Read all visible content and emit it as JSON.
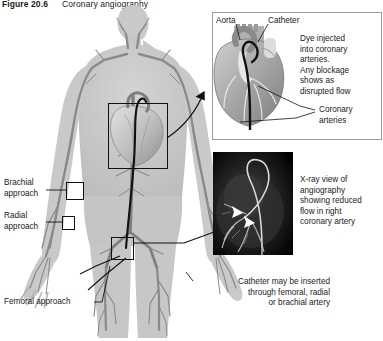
{
  "figure": {
    "number": "Figure 20.6",
    "title": "Coronary angiography"
  },
  "body_diagram": {
    "name": "human-body-vascular-silhouette",
    "markers": [
      {
        "id": "brachial",
        "label": "Brachial\napproach"
      },
      {
        "id": "radial",
        "label": "Radial\napproach"
      },
      {
        "id": "femoral",
        "label": "Femoral approach"
      },
      {
        "id": "heart",
        "label": ""
      }
    ],
    "caption": "Catheter may be inserted\nthrough femoral, radial\nor brachial artery"
  },
  "heart_inset": {
    "labels": {
      "aorta": "Aorta",
      "catheter": "Catheter",
      "coronary_arteries": "Coronary\narteries"
    },
    "description": "Dye injected\ninto coronary\narteries.\nAny blockage\nshows as\ndisrupted flow"
  },
  "xray_inset": {
    "caption": "X-ray view of\nangiography\nshowing reduced\nflow in right\ncoronary artery",
    "arrows": 2
  },
  "colors": {
    "body_fill": "#c9c9c9",
    "vessel": "#8a8a8a",
    "vessel_dark": "#6e6e6e",
    "heart_light": "#d8d8d8",
    "heart_mid": "#a8a8a8",
    "heart_dark": "#7c7c7c",
    "catheter": "#111111",
    "panel_border": "#9a9a9a",
    "xray_bg": "#000000",
    "text": "#1a1a1a"
  }
}
